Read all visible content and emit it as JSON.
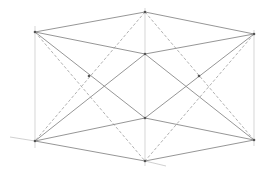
{
  "figure": {
    "type": "wireframe-3d-geometry",
    "background": "#ffffff",
    "colors": {
      "solid_edge": "#8a8a8a",
      "heavy_edge": "#6e6e6e",
      "dashed_edge": "#a8a8a8",
      "axis": "#c4c4c4",
      "vertex": "#555555"
    },
    "vertices": [
      {
        "id": "TL",
        "x": 35,
        "y": 32
      },
      {
        "id": "TC",
        "x": 145,
        "y": 12
      },
      {
        "id": "TR",
        "x": 254,
        "y": 34
      },
      {
        "id": "MU",
        "x": 145,
        "y": 54
      },
      {
        "id": "ML",
        "x": 145,
        "y": 118
      },
      {
        "id": "BL",
        "x": 35,
        "y": 141
      },
      {
        "id": "BC",
        "x": 145,
        "y": 161
      },
      {
        "id": "BR",
        "x": 254,
        "y": 140
      },
      {
        "id": "XL",
        "x": 89,
        "y": 76
      },
      {
        "id": "XR",
        "x": 199,
        "y": 76
      }
    ],
    "solid_edges": [
      [
        "TL",
        "TC"
      ],
      [
        "TC",
        "TR"
      ],
      [
        "TL",
        "MU"
      ],
      [
        "MU",
        "TR"
      ],
      [
        "BL",
        "ML"
      ],
      [
        "ML",
        "BR"
      ],
      [
        "BL",
        "BC"
      ],
      [
        "BC",
        "BR"
      ],
      [
        "TL",
        "ML"
      ],
      [
        "TR",
        "ML"
      ],
      [
        "BL",
        "MU"
      ],
      [
        "BR",
        "MU"
      ]
    ],
    "dashed_edges": [
      [
        "TC",
        "BL"
      ],
      [
        "TC",
        "BR"
      ],
      [
        "TL",
        "BC"
      ],
      [
        "TR",
        "BC"
      ]
    ],
    "vertical_guides": [
      {
        "x": 35,
        "y1": 26,
        "y2": 148
      },
      {
        "x": 145,
        "y1": 8,
        "y2": 166
      },
      {
        "x": 254,
        "y1": 30,
        "y2": 146
      }
    ],
    "axis_lines": [
      {
        "x1": 10,
        "y1": 137,
        "x2": 35,
        "y2": 141
      },
      {
        "x1": 145,
        "y1": 161,
        "x2": 166,
        "y2": 166
      }
    ]
  }
}
